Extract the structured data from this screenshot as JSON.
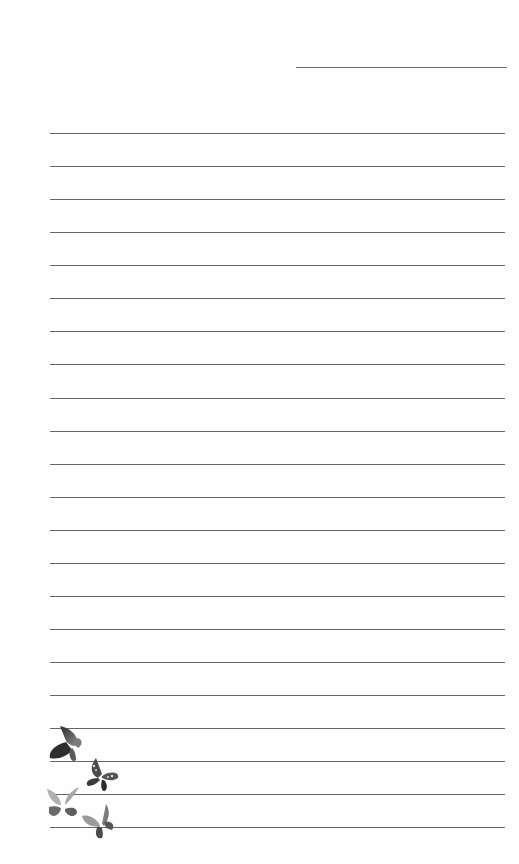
{
  "page": {
    "type": "lined-notepaper",
    "background": "#ffffff",
    "line_color": "#666666",
    "header_line": {
      "left": 296,
      "top": 67,
      "width": 211
    },
    "rules": {
      "left": 50,
      "width": 455,
      "count": 22,
      "tops": [
        133,
        166,
        199,
        232,
        265,
        298,
        331,
        364,
        398,
        431,
        464,
        497,
        530,
        563,
        596,
        629,
        662,
        695,
        728,
        761,
        794,
        827
      ]
    },
    "decorations": [
      {
        "icon": "butterfly-icon",
        "shade": "dark"
      },
      {
        "icon": "butterfly-icon",
        "shade": "spotted"
      },
      {
        "icon": "butterfly-icon",
        "shade": "light"
      },
      {
        "icon": "butterfly-icon",
        "shade": "medium"
      }
    ]
  }
}
